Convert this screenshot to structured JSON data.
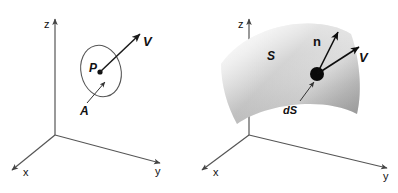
{
  "figure": {
    "background_color": "#ffffff",
    "stroke_color": "#444444",
    "label_color": "#111111"
  },
  "panels": [
    {
      "id": "left",
      "name": "flat-area-panel",
      "axes": {
        "x_label": "x",
        "y_label": "y",
        "z_label": "z"
      },
      "labels": {
        "point": "P",
        "area": "A",
        "vector": "V"
      },
      "shapes": {
        "area_outline": "ellipse",
        "point_marker": "filled-dot",
        "vector_arrow": "V"
      }
    },
    {
      "id": "right",
      "name": "curved-surface-panel",
      "axes": {
        "x_label": "x",
        "y_label": "y",
        "z_label": "z"
      },
      "labels": {
        "surface": "S",
        "element": "dS",
        "normal": "n",
        "vector": "V"
      },
      "shapes": {
        "surface_outline": "curved-patch",
        "point_marker": "filled-dot",
        "normal_arrow": "n",
        "vector_arrow": "V"
      },
      "surface_shading": {
        "light": "#f2f2f2",
        "mid": "#d8d8d8",
        "dark": "#b4b4b4"
      }
    }
  ]
}
